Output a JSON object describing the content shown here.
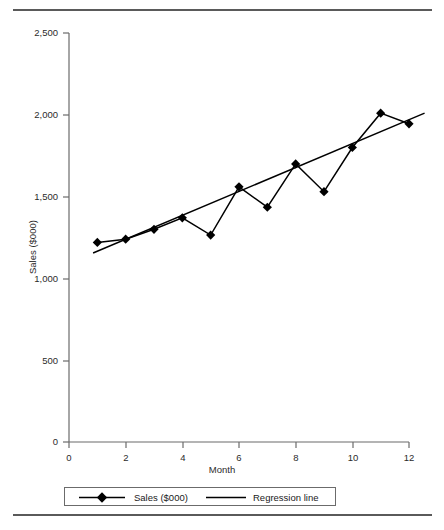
{
  "chart_data": {
    "type": "line",
    "title": "",
    "subtitle": "",
    "xlabel": "Month",
    "ylabel": "Sales ($000)",
    "xlim": [
      0,
      12
    ],
    "ylim": [
      0,
      2500
    ],
    "x": [
      1,
      2,
      3,
      4,
      5,
      6,
      7,
      8,
      9,
      10,
      11,
      12
    ],
    "xticks": [
      0,
      2,
      4,
      6,
      8,
      10,
      12
    ],
    "xtick_labels": [
      "0",
      "2",
      "4",
      "6",
      "8",
      "10",
      "12"
    ],
    "yticks": [
      0,
      500,
      1000,
      1500,
      2000,
      2500
    ],
    "ytick_labels": [
      "0",
      "500",
      "1,000",
      "1,500",
      "2,000",
      "2,500"
    ],
    "grid": false,
    "legend_position": "below-axes",
    "series": [
      {
        "name": "Sales ($000)",
        "kind": "line-with-markers",
        "marker": "diamond",
        "color": "#000000",
        "values": [
          1220,
          1240,
          1300,
          1370,
          1265,
          1560,
          1435,
          1700,
          1530,
          1800,
          2010,
          1945
        ]
      },
      {
        "name": "Regression line",
        "kind": "line",
        "marker": "none",
        "color": "#000000",
        "x_endpoints": [
          0.85,
          12.55
        ],
        "y_endpoints": [
          1155,
          2010
        ]
      }
    ]
  },
  "axes": {
    "y_axis_label": "Sales ($000)",
    "x_axis_label": "Month",
    "y_tick_labels": [
      "2,500",
      "2,000",
      "1,500",
      "1,000",
      "500",
      "0"
    ],
    "x_tick_labels": [
      "0",
      "2",
      "4",
      "6",
      "8",
      "10",
      "12"
    ]
  },
  "legend": {
    "series_label": "Sales ($000)",
    "trend_label": "Regression line"
  },
  "colors": {
    "line": "#000000",
    "marker": "#000000",
    "axis": "#6b6b6b",
    "rule": "#5a5a5a",
    "text": "#1a1a1a"
  }
}
